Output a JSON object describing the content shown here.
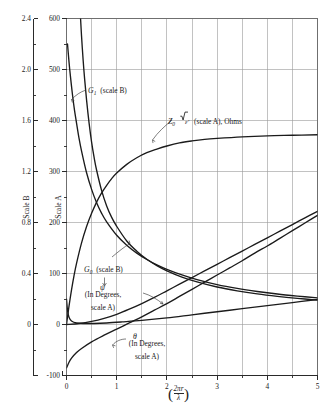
{
  "figure": {
    "background": "#ffffff",
    "curve_color": "#1b1b1b",
    "grid_color": "#9a9a9a",
    "frame_color": "#6f6f6f",
    "axis_color": "#2a2a2a"
  },
  "axes": {
    "scale_b": {
      "title": "Scale B",
      "ticks": [
        "2.4",
        "2.0",
        "1.6",
        "1.2",
        "0.8",
        "0.4",
        "0"
      ],
      "tick_values": [
        2.4,
        2.0,
        1.6,
        1.2,
        0.8,
        0.4,
        0
      ],
      "minor_step": 0.2,
      "range": [
        -0.4,
        2.4
      ]
    },
    "scale_a": {
      "title": "Scale A",
      "ticks": [
        "600",
        "500",
        "400",
        "300",
        "200",
        "100",
        "0",
        "-100"
      ],
      "tick_values": [
        600,
        500,
        400,
        300,
        200,
        100,
        0,
        -100
      ],
      "minor_step": 50,
      "range": [
        -100,
        600
      ]
    },
    "x": {
      "ticks": [
        "0",
        "1",
        "2",
        "3",
        "4",
        "5"
      ],
      "tick_values": [
        0,
        1,
        2,
        3,
        4,
        5
      ],
      "minor_step": 0.5,
      "range": [
        0,
        5
      ],
      "label_numerator": "2πr",
      "label_denominator": "λ",
      "label_open": "(",
      "label_close": ")"
    }
  },
  "annotations": [
    {
      "id": "g1",
      "symbol": "G",
      "subscript": "1",
      "text": "(scale B)"
    },
    {
      "id": "z0",
      "symbol": "Z",
      "subscript": "0",
      "radicand": "ε′",
      "text": "(scale A), Ohms"
    },
    {
      "id": "g0",
      "symbol": "G",
      "subscript": "0",
      "text": "(scale B)"
    },
    {
      "id": "psi",
      "symbol": "ψ",
      "line1": "(In Degrees,",
      "line2": "scale A)"
    },
    {
      "id": "theta",
      "symbol": "θ",
      "line1": "(In Degrees,",
      "line2": "scale A)"
    }
  ],
  "chart_data": {
    "type": "line",
    "title": "",
    "xlabel": "(2πr/λ)",
    "ylabel": "Scale B / Scale A",
    "xlim": [
      0,
      5
    ],
    "ylim_scale_b": [
      -0.4,
      2.4
    ],
    "ylim_scale_a": [
      -100,
      600
    ],
    "grid": true,
    "legend": "inline-annotations",
    "series": [
      {
        "name": "G1",
        "scale": "B",
        "label": "G₁ (scale B)",
        "x": [
          0.28,
          0.3,
          0.33,
          0.36,
          0.4,
          0.45,
          0.5,
          0.55,
          0.6,
          0.7,
          0.8,
          0.9,
          1.0,
          1.2,
          1.4,
          1.6,
          1.8,
          2.0,
          2.3,
          2.6,
          3.0,
          3.4,
          3.8,
          4.2,
          4.6,
          5.0
        ],
        "values": [
          2.4,
          2.26,
          2.08,
          1.93,
          1.76,
          1.58,
          1.43,
          1.31,
          1.21,
          1.05,
          0.93,
          0.84,
          0.77,
          0.655,
          0.575,
          0.512,
          0.462,
          0.421,
          0.372,
          0.334,
          0.294,
          0.264,
          0.24,
          0.221,
          0.205,
          0.191
        ]
      },
      {
        "name": "G0",
        "scale": "B",
        "label": "G₀ (scale B)",
        "x": [
          0.02,
          0.05,
          0.08,
          0.12,
          0.16,
          0.2,
          0.25,
          0.3,
          0.4,
          0.5,
          0.6,
          0.7,
          0.8,
          1.0,
          1.2,
          1.4,
          1.6,
          1.8,
          2.0,
          2.3,
          2.6,
          3.0,
          3.4,
          3.8,
          4.2,
          4.6,
          5.0
        ],
        "values": [
          2.2,
          2.06,
          1.94,
          1.8,
          1.68,
          1.58,
          1.46,
          1.36,
          1.19,
          1.06,
          0.955,
          0.872,
          0.805,
          0.7,
          0.622,
          0.56,
          0.51,
          0.468,
          0.433,
          0.389,
          0.352,
          0.313,
          0.283,
          0.259,
          0.239,
          0.223,
          0.209
        ]
      },
      {
        "name": "Z0 sqrt(eps')",
        "scale": "A",
        "label": "Z₀ √ε′ (scale A), Ohms",
        "units": "Ohms",
        "x": [
          0.0,
          0.05,
          0.1,
          0.15,
          0.2,
          0.3,
          0.4,
          0.5,
          0.6,
          0.7,
          0.8,
          0.9,
          1.0,
          1.2,
          1.4,
          1.6,
          1.8,
          2.0,
          2.25,
          2.5,
          2.75,
          3.0,
          3.5,
          4.0,
          4.5,
          5.0
        ],
        "values": [
          0,
          36,
          68,
          96,
          120,
          160,
          192,
          218,
          240,
          258,
          273,
          286,
          297,
          314,
          327,
          337,
          344,
          350,
          356,
          360,
          363,
          365,
          368,
          370,
          371,
          372
        ]
      },
      {
        "name": "psi",
        "scale": "A",
        "label": "ψ (In Degrees, scale A)",
        "units": "degrees",
        "x": [
          0.0,
          0.25,
          0.5,
          0.75,
          1.0,
          1.25,
          1.5,
          1.75,
          2.0,
          2.25,
          2.5,
          2.75,
          3.0,
          3.25,
          3.5,
          3.75,
          4.0,
          4.25,
          4.5,
          4.75,
          5.0
        ],
        "values": [
          0,
          2,
          6,
          12,
          20,
          30,
          41,
          53,
          66,
          79,
          92,
          105,
          118,
          131,
          144,
          157,
          170,
          183,
          196,
          209,
          222
        ]
      },
      {
        "name": "theta",
        "scale": "A",
        "label": "θ (In Degrees, scale A)",
        "units": "degrees",
        "x": [
          0.0,
          0.05,
          0.1,
          0.2,
          0.3,
          0.5,
          0.75,
          1.0,
          1.25,
          1.5,
          1.75,
          2.0,
          2.25,
          2.5,
          2.75,
          3.0,
          3.25,
          3.5,
          3.75,
          4.0,
          4.25,
          4.5,
          4.75,
          5.0
        ],
        "values": [
          -85,
          -74,
          -66,
          -55,
          -47,
          -34,
          -21,
          -9,
          3,
          15,
          28,
          41,
          55,
          69,
          83,
          97,
          111,
          125,
          140,
          154,
          169,
          184,
          199,
          214
        ]
      },
      {
        "name": "Z0 lower branch",
        "scale": "A",
        "label": "",
        "x": [
          0.0,
          0.02,
          0.05,
          0.1,
          0.2,
          0.35,
          0.55,
          0.8,
          1.1,
          1.5,
          2.0,
          2.5,
          3.0,
          3.5,
          4.0,
          4.5,
          5.0
        ],
        "values": [
          50,
          28,
          14,
          7,
          3,
          2,
          2,
          3,
          5,
          8,
          13,
          19,
          25,
          31,
          37,
          43,
          49
        ]
      }
    ]
  }
}
